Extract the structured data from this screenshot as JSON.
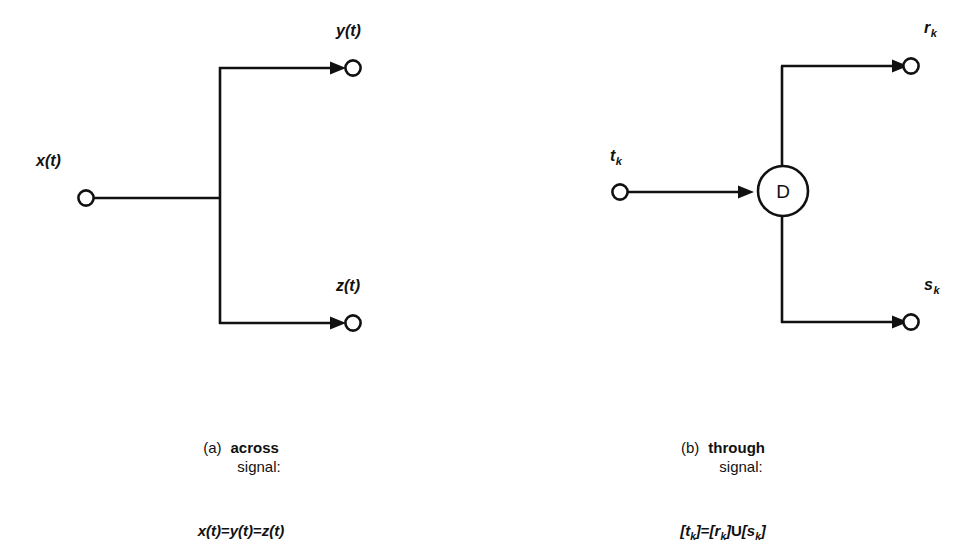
{
  "figure": {
    "background_color": "#ffffff",
    "stroke_color": "#111111",
    "panels": [
      {
        "id": "across",
        "caption_tag": "(a)",
        "caption_term": "across",
        "caption_subtitle": "signal:",
        "formula_plain": "x(t)=y(t)=z(t)",
        "formula_parts": [
          {
            "text": "x(t)",
            "kind": "var"
          },
          {
            "text": "=",
            "kind": "op"
          },
          {
            "text": "y(t)",
            "kind": "var"
          },
          {
            "text": "=",
            "kind": "op"
          },
          {
            "text": "z(t)",
            "kind": "var"
          }
        ],
        "source_port": {
          "label_base": "x(t)",
          "label_sub": ""
        },
        "output_ports": [
          {
            "label_base": "y(t)",
            "label_sub": ""
          },
          {
            "label_base": "z(t)",
            "label_sub": ""
          }
        ],
        "block": null
      },
      {
        "id": "through",
        "caption_tag": "(b)",
        "caption_term": "through",
        "caption_subtitle": "signal:",
        "formula_plain": "[t_k]=[r_k]U[s_k]",
        "formula_parts": [
          {
            "text": "[t",
            "kind": "var"
          },
          {
            "text": "k",
            "kind": "sub"
          },
          {
            "text": "]",
            "kind": "var"
          },
          {
            "text": "=",
            "kind": "op"
          },
          {
            "text": "[r",
            "kind": "var"
          },
          {
            "text": "k",
            "kind": "sub"
          },
          {
            "text": "]",
            "kind": "var"
          },
          {
            "text": "U",
            "kind": "op"
          },
          {
            "text": "[s",
            "kind": "var"
          },
          {
            "text": "k",
            "kind": "sub"
          },
          {
            "text": "]",
            "kind": "var"
          }
        ],
        "source_port": {
          "label_base": "t",
          "label_sub": "k"
        },
        "output_ports": [
          {
            "label_base": "r",
            "label_sub": "k"
          },
          {
            "label_base": "s",
            "label_sub": "k"
          }
        ],
        "block": {
          "letter": "D",
          "shape": "circle"
        }
      }
    ]
  }
}
